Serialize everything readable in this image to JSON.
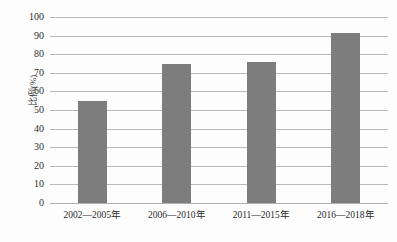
{
  "chart_data": {
    "type": "bar",
    "title": "",
    "subtitle": "",
    "xlabel": "",
    "ylabel": "比例(%)",
    "categories": [
      "2002—2005年",
      "2006—2010年",
      "2011—2015年",
      "2016—2018年"
    ],
    "values": [
      55,
      75,
      76,
      91.5
    ],
    "series": [
      {
        "name": "比例(%)",
        "values": [
          55,
          75,
          76,
          91.5
        ]
      }
    ],
    "ylim": [
      0,
      100
    ],
    "yticks": [
      0,
      10,
      20,
      30,
      40,
      50,
      60,
      70,
      80,
      90,
      100
    ],
    "ytick_labels": [
      "0",
      "10",
      "20",
      "30",
      "40",
      "50",
      "60",
      "70",
      "80",
      "90",
      "100"
    ],
    "grid": true,
    "grid_axis": "y",
    "legend": false,
    "legend_position": "none",
    "bar_color": "#7d7d7d",
    "gridline_color": "#b9b9b9",
    "background_color": "#fdfdfd",
    "annotations": []
  },
  "axis": {
    "y_title": "比例(%)"
  }
}
